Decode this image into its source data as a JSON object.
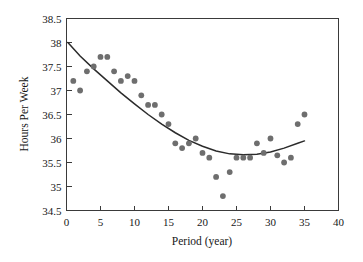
{
  "chart_data": {
    "type": "scatter",
    "title": "",
    "xlabel": "Period (year)",
    "ylabel": "Hours Per Week",
    "xlim": [
      0,
      40
    ],
    "ylim": [
      34.5,
      38.5
    ],
    "xticks": [
      0,
      5,
      10,
      15,
      20,
      25,
      30,
      35,
      40
    ],
    "xtick_labels": [
      "0",
      "5",
      "10",
      "15",
      "20",
      "25",
      "30",
      "35",
      "40"
    ],
    "yticks": [
      34.5,
      35,
      35.5,
      36,
      36.5,
      37,
      37.5,
      38,
      38.5
    ],
    "ytick_labels": [
      "34.5",
      "35",
      "35.5",
      "36",
      "36.5",
      "37",
      "37.5",
      "38",
      "38.5"
    ],
    "grid": false,
    "legend": "none",
    "marker_color": "#6e6e6e",
    "curve_color": "#2b2b2b",
    "axis_color": "#3a3a3a",
    "background_color": "#ffffff",
    "series": [
      {
        "name": "Observed hours per week",
        "type": "scatter",
        "x": [
          1,
          2,
          3,
          4,
          5,
          6,
          7,
          8,
          9,
          10,
          11,
          12,
          13,
          14,
          15,
          16,
          17,
          18,
          19,
          20,
          21,
          22,
          23,
          24,
          25,
          26,
          27,
          28,
          29,
          30,
          31,
          32,
          33,
          34,
          35
        ],
        "y": [
          37.2,
          37.0,
          37.4,
          37.5,
          37.7,
          37.7,
          37.4,
          37.2,
          37.3,
          37.2,
          36.9,
          36.7,
          36.7,
          36.5,
          36.3,
          35.9,
          35.8,
          35.9,
          36.0,
          35.7,
          35.6,
          35.2,
          34.8,
          35.3,
          35.6,
          35.6,
          35.6,
          35.9,
          35.7,
          36.0,
          35.65,
          35.5,
          35.6,
          36.3,
          36.5
        ]
      },
      {
        "name": "Fitted quadratic trend",
        "type": "line",
        "x": [
          0.2,
          2,
          4,
          6,
          8,
          10,
          12,
          14,
          16,
          18,
          20,
          22,
          24,
          26,
          28,
          30,
          32,
          34,
          35
        ],
        "y": [
          38.0,
          37.72,
          37.45,
          37.2,
          36.95,
          36.72,
          36.5,
          36.3,
          36.12,
          35.96,
          35.84,
          35.74,
          35.68,
          35.66,
          35.67,
          35.72,
          35.8,
          35.9,
          35.95
        ]
      }
    ]
  },
  "axes": {
    "y_title": "Hours Per Week",
    "x_title": "Period (year)"
  }
}
